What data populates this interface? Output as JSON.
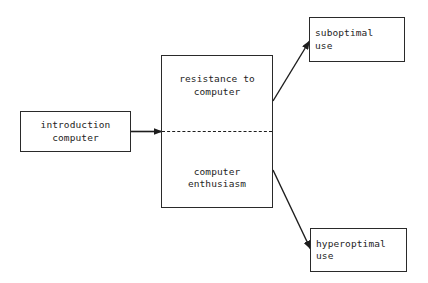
{
  "diagram": {
    "background_color": "#ffffff",
    "stroke_color": "#2a2a2a",
    "text_color": "#1d1d1d",
    "nodes": {
      "introduction": {
        "lines": [
          "introduction",
          "computer"
        ],
        "line1": "introduction",
        "line2": "computer"
      },
      "attitude": {
        "top": {
          "line1": "resistance to",
          "line2": "computer"
        },
        "bottom": {
          "line1": "computer",
          "line2": "enthusiasm"
        },
        "divider_style": "dashed"
      },
      "suboptimal": {
        "line1": "suboptimal",
        "line2": "use"
      },
      "hyperoptimal": {
        "line1": "hyperoptimal",
        "line2": "use"
      }
    },
    "edges": [
      {
        "name": "introduction-to-attitude",
        "from": "introduction",
        "to": "attitude",
        "style": "solid-arrow"
      },
      {
        "name": "attitude-to-suboptimal",
        "from": "attitude",
        "to": "suboptimal",
        "style": "solid-arrow"
      },
      {
        "name": "attitude-to-hyperoptimal",
        "from": "attitude",
        "to": "hyperoptimal",
        "style": "solid-arrow"
      }
    ]
  }
}
